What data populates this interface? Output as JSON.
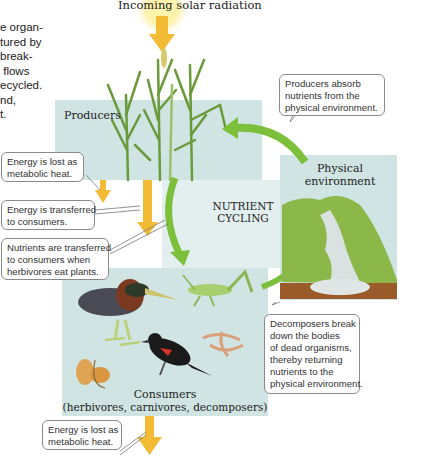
{
  "intro_text": "e organ-\ntured by\nbreak-\n flows\necycled.\nnd,\nt.",
  "header": {
    "solar_label": "Incoming solar radiation"
  },
  "panels": {
    "producers": {
      "label": "Producers"
    },
    "physical_environment": {
      "label": "Physical\nenvironment"
    },
    "consumers": {
      "label": "Consumers",
      "sublabel": "(herbivores, carnivores, decomposers)"
    },
    "center": {
      "label": "NUTRIENT\nCYCLING"
    }
  },
  "callouts": {
    "producers_absorb": "Producers absorb\nnutrients from the\nphysical environment.",
    "energy_lost_top": "Energy is lost as\nmetabolic heat.",
    "energy_transferred": "Energy is transferred\nto consumers.",
    "nutrients_transferred": "Nutrients are transferred\nto consumers when\nherbivores eat plants.",
    "decomposers": "Decomposers break\ndown the bodies\nof dead organisms,\nthereby returning\nnutrients to the\nphysical environment.",
    "energy_lost_bottom": "Energy is lost as\nmetabolic heat."
  },
  "colors": {
    "panel_bg": "#cfe4e3",
    "energy_arrow": "#f2bb33",
    "nutrient_arrow": "#7bbf3a",
    "soil": "#9a5a2a",
    "grass": "#7aa63c"
  }
}
